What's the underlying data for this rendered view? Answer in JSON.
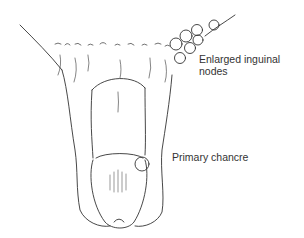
{
  "figure": {
    "labels": {
      "enlarged_nodes_line1": "Enlarged inguinal",
      "enlarged_nodes_line2": "nodes",
      "primary_chancre": "Primary chancre"
    }
  },
  "colors": {
    "ink": "#333333",
    "background": "#ffffff"
  }
}
